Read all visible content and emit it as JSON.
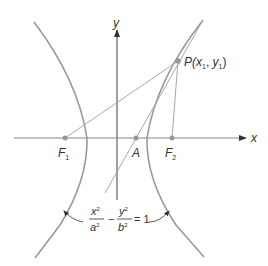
{
  "diagram": {
    "type": "hyperbola-reflection",
    "colors": {
      "curve": "#9a9a9a",
      "axis": "#888888",
      "line": "#a8a8a8",
      "point": "#999999",
      "text": "#333333",
      "arrowhead": "#333333"
    },
    "axes": {
      "x_label": "x",
      "y_label": "y"
    },
    "points": {
      "F1": {
        "label": "F",
        "sub": "1"
      },
      "A": {
        "label": "A"
      },
      "F2": {
        "label": "F",
        "sub": "2"
      },
      "P": {
        "label_pre": "P(",
        "x": "x",
        "x_sub": "1",
        "sep": ", ",
        "y": "y",
        "y_sub": "1",
        "label_post": ")"
      }
    },
    "equation": {
      "num1": "x",
      "num1_sup": "2",
      "den1": "a",
      "den1_sup": "2",
      "minus": "−",
      "num2": "y",
      "num2_sup": "2",
      "den2": "b",
      "den2_sup": "2",
      "equals": "= 1"
    }
  }
}
